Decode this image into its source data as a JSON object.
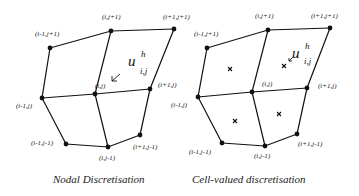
{
  "left": {
    "caption": "Nodal Discretisation",
    "var": {
      "base": "u",
      "sup": "h",
      "sub": "i,j"
    },
    "nodes": {
      "im1_jp1": "(i-1,j+1)",
      "i_jp1": "(i,j+1)",
      "ip1_jp1": "(i+1,j+1)",
      "im1_j": "(i-1,j)",
      "i_j": "(i,j)",
      "ip1_j": "(i+1,j)",
      "im1_jm1": "(i-1,j-1)",
      "i_jm1": "(i,j-1)",
      "ip1_jm1": "(i+1,j-1)"
    }
  },
  "right": {
    "caption": "Cell-valued discretisation",
    "var": {
      "base": "u",
      "sup": "h",
      "sub": "i,j"
    },
    "nodes": {
      "im1_jp1": "(i-1,j+1)",
      "i_jp1": "(i,j+1)",
      "ip1_jp1": "(i+1,j+1)",
      "im1_j": "(i-1,j)",
      "i_j": "(i,j)",
      "ip1_j": "(i+1,j)",
      "im1_jm1": "(i-1,j-1)",
      "i_jm1": "(i,j-1)",
      "ip1_jm1": "(i+1,j-1)"
    },
    "cell_marker": "×"
  }
}
